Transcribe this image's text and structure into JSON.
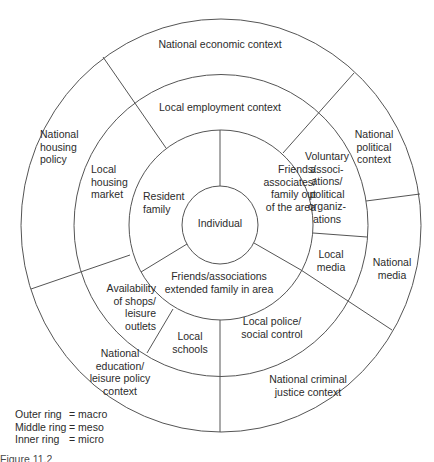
{
  "figure": {
    "type": "concentric-rings-diagram",
    "center": {
      "x": 221,
      "y": 225
    },
    "rings": [
      {
        "name": "inner",
        "level": "micro",
        "radius": 38
      },
      {
        "name": "inner-middle-boundary",
        "radius": 94
      },
      {
        "name": "middle-boundary",
        "radius": 150
      },
      {
        "name": "outer-boundary",
        "radius": 203
      }
    ],
    "stroke_color": "#555555",
    "text_color": "#2b2b2b"
  },
  "center_label": "Individual",
  "inner_ring": {
    "level": "micro",
    "segments": [
      {
        "label": "Resident\nfamily"
      },
      {
        "label": "Friends/\nassociates/\nfamily out\nof the area"
      },
      {
        "label": "Friends/associations\nextended family in area"
      }
    ]
  },
  "middle_ring": {
    "level": "meso",
    "segments": [
      {
        "label": "Local employment context"
      },
      {
        "label": "Local\nhousing\nmarket"
      },
      {
        "label": "Voluntary\nassoci-\nations/\npolitical\norganiz-\nations"
      },
      {
        "label": "Local\nmedia"
      },
      {
        "label": "Availability\nof shops/\nleisure\noutlets"
      },
      {
        "label": "Local\nschools"
      },
      {
        "label": "Local police/\nsocial control"
      }
    ]
  },
  "outer_ring": {
    "level": "macro",
    "segments": [
      {
        "label": "National economic context"
      },
      {
        "label": "National\nhousing\npolicy"
      },
      {
        "label": "National\npolitical\ncontext"
      },
      {
        "label": "National\nmedia"
      },
      {
        "label": "National\neducation/\nleisure policy\ncontext"
      },
      {
        "label": "National criminal\njustice context"
      }
    ]
  },
  "legend": [
    {
      "key": "Outer ring",
      "value": "= macro"
    },
    {
      "key": "Middle ring",
      "value": "= meso"
    },
    {
      "key": "Inner ring",
      "value": "= micro"
    }
  ],
  "caption": "Figure 11.2"
}
